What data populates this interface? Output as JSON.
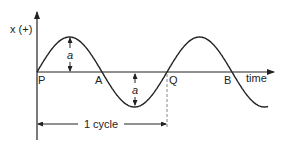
{
  "diagram": {
    "y_axis_label": "x (+)",
    "x_axis_label": "time",
    "points": {
      "P": "P",
      "A": "A",
      "Q": "Q",
      "B": "B"
    },
    "amplitude_label": "a",
    "cycle_label": "1 cycle",
    "colors": {
      "line": "#222222",
      "dashed": "#888888"
    }
  }
}
